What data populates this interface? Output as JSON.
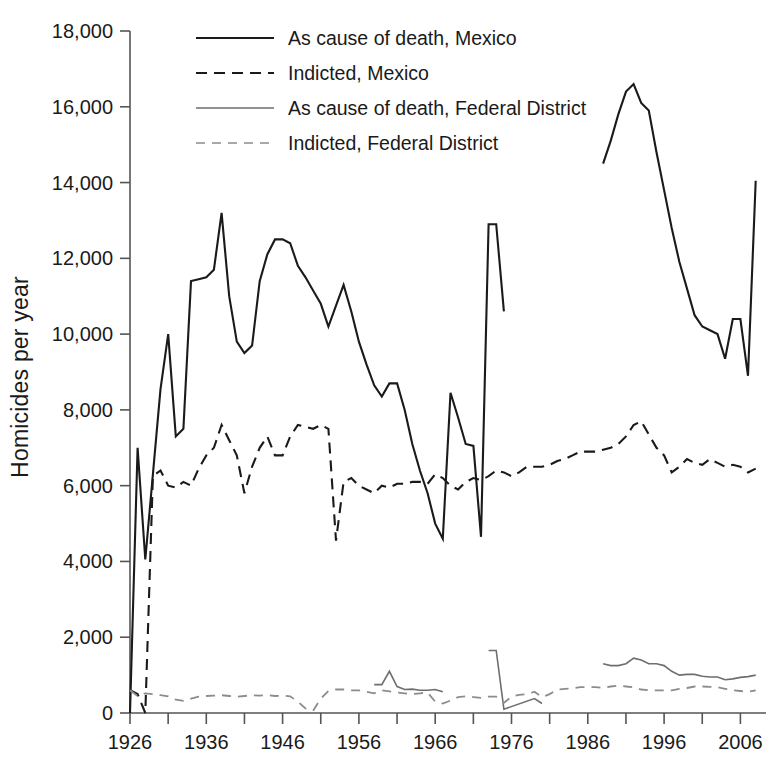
{
  "figure": {
    "title": "",
    "ylabel": "Homicides per year",
    "xlabel": ""
  },
  "axes": {
    "y_ticks": [
      "0",
      "2,000",
      "4,000",
      "6,000",
      "8,000",
      "10,000",
      "12,000",
      "14,000",
      "16,000",
      "18,000"
    ],
    "x_ticks": [
      "1926",
      "1936",
      "1946",
      "1956",
      "1966",
      "1976",
      "1986",
      "1996",
      "2006"
    ],
    "y_min": 0,
    "y_max": 18000,
    "x_min": 1926,
    "x_max": 2008,
    "minor_tick_step_years": 5
  },
  "legend": {
    "items": [
      {
        "label": "As cause of death, Mexico",
        "style": "solid",
        "color": "#1a1a1a",
        "width": 2.1
      },
      {
        "label": "Indicted, Mexico",
        "style": "dashed",
        "color": "#1a1a1a",
        "width": 2.1
      },
      {
        "label": "As cause of death, Federal District",
        "style": "solid",
        "color": "#6e6e6e",
        "width": 1.5
      },
      {
        "label": "Indicted, Federal District",
        "style": "dashed",
        "color": "#8c8c8c",
        "width": 1.7
      }
    ]
  },
  "chart_data": {
    "type": "line",
    "title": "",
    "xlabel": "",
    "ylabel": "Homicides per year",
    "xlim": [
      1926,
      2008
    ],
    "ylim": [
      0,
      18000
    ],
    "grid": false,
    "legend_position": "top-center",
    "series": [
      {
        "name": "As cause of death, Mexico",
        "style": "solid",
        "color": "#1a1a1a",
        "x": [
          1926,
          1927,
          1928,
          1930,
          1931,
          1932,
          1933,
          1934,
          1935,
          1936,
          1937,
          1938,
          1939,
          1940,
          1941,
          1942,
          1943,
          1944,
          1945,
          1946,
          1947,
          1948,
          1949,
          1950,
          1951,
          1952,
          1953,
          1954,
          1955,
          1956,
          1957,
          1958,
          1959,
          1960,
          1961,
          1962,
          1963,
          1964,
          1965,
          1966,
          1967,
          1968,
          1969,
          1970,
          1971,
          1972,
          1973,
          1974,
          1975,
          1988,
          1989,
          1990,
          1991,
          1992,
          1993,
          1994,
          1995,
          1996,
          1997,
          1998,
          1999,
          2000,
          2001,
          2002,
          2003,
          2004,
          2005,
          2006,
          2007,
          2008
        ],
        "values": [
          0,
          7000,
          4050,
          8550,
          10000,
          7300,
          7500,
          11400,
          11450,
          11500,
          11700,
          13200,
          11000,
          9800,
          9500,
          9700,
          11400,
          12100,
          12500,
          12500,
          12400,
          11800,
          11500,
          11150,
          10800,
          10200,
          10750,
          11300,
          10600,
          9800,
          9200,
          8650,
          8350,
          8700,
          8700,
          8000,
          7100,
          6400,
          5800,
          5000,
          4600,
          8450,
          7800,
          7100,
          7050,
          4650,
          12900,
          12900,
          10600,
          14500,
          15100,
          15800,
          16400,
          16600,
          16100,
          15900,
          14800,
          13800,
          12800,
          11900,
          11200,
          10500,
          10200,
          10100,
          10000,
          9350,
          10400,
          10400,
          8900,
          14050
        ]
      },
      {
        "name": "Indicted, Mexico",
        "style": "dashed",
        "color": "#1a1a1a",
        "x": [
          1926,
          1927,
          1928,
          1929,
          1930,
          1931,
          1932,
          1933,
          1934,
          1935,
          1936,
          1937,
          1938,
          1939,
          1940,
          1941,
          1942,
          1943,
          1944,
          1945,
          1946,
          1947,
          1948,
          1949,
          1950,
          1951,
          1952,
          1953,
          1954,
          1955,
          1956,
          1957,
          1958,
          1959,
          1960,
          1961,
          1962,
          1963,
          1964,
          1965,
          1966,
          1967,
          1968,
          1969,
          1970,
          1971,
          1972,
          1973,
          1974,
          1975,
          1976,
          1977,
          1978,
          1979,
          1980,
          1981,
          1982,
          1983,
          1984,
          1985,
          1986,
          1987,
          1988,
          1989,
          1990,
          1991,
          1992,
          1993,
          1994,
          1995,
          1996,
          1997,
          1998,
          1999,
          2000,
          2001,
          2002,
          2003,
          2004,
          2005,
          2006,
          2007,
          2008
        ],
        "values": [
          600,
          500,
          0,
          6250,
          6400,
          6000,
          5950,
          6100,
          6000,
          6450,
          6800,
          7000,
          7600,
          7200,
          6800,
          5800,
          6500,
          7000,
          7300,
          6800,
          6800,
          7300,
          7600,
          7550,
          7500,
          7600,
          7500,
          4550,
          6100,
          6200,
          6000,
          5900,
          5800,
          6000,
          5950,
          6050,
          6050,
          6100,
          6100,
          6050,
          6300,
          6200,
          6000,
          5900,
          6100,
          6200,
          6150,
          6250,
          6400,
          6350,
          6250,
          6350,
          6500,
          6500,
          6500,
          6550,
          6650,
          6700,
          6800,
          6900,
          6900,
          6900,
          6950,
          7000,
          7100,
          7300,
          7600,
          7700,
          7350,
          7000,
          6800,
          6350,
          6500,
          6700,
          6600,
          6550,
          6700,
          6600,
          6500,
          6550,
          6500,
          6350,
          6450
        ]
      },
      {
        "name": "As cause of death, Federal District",
        "style": "solid",
        "color": "#6e6e6e",
        "x": [
          1958,
          1959,
          1960,
          1961,
          1962,
          1963,
          1964,
          1965,
          1966,
          1967,
          1973,
          1974,
          1975,
          1979,
          1980,
          1988,
          1989,
          1990,
          1991,
          1992,
          1993,
          1994,
          1995,
          1996,
          1997,
          1998,
          1999,
          2000,
          2001,
          2002,
          2003,
          2004,
          2005,
          2006,
          2007,
          2008
        ],
        "values": [
          750,
          750,
          1100,
          700,
          620,
          630,
          600,
          600,
          620,
          560,
          1650,
          1650,
          100,
          380,
          250,
          1300,
          1250,
          1250,
          1300,
          1450,
          1400,
          1300,
          1300,
          1250,
          1100,
          1000,
          1020,
          1020,
          970,
          950,
          950,
          880,
          900,
          940,
          960,
          1000
        ]
      },
      {
        "name": "Indicted, Federal District",
        "style": "dashed",
        "color": "#8c8c8c",
        "x": [
          1926,
          1927,
          1928,
          1929,
          1930,
          1931,
          1932,
          1933,
          1934,
          1935,
          1936,
          1937,
          1938,
          1939,
          1940,
          1941,
          1942,
          1943,
          1944,
          1945,
          1946,
          1947,
          1948,
          1949,
          1950,
          1951,
          1952,
          1953,
          1954,
          1955,
          1956,
          1957,
          1958,
          1959,
          1960,
          1961,
          1962,
          1963,
          1964,
          1965,
          1966,
          1967,
          1968,
          1969,
          1970,
          1971,
          1972,
          1973,
          1974,
          1975,
          1976,
          1977,
          1978,
          1979,
          1980,
          1981,
          1982,
          1983,
          1984,
          1985,
          1986,
          1987,
          1988,
          1989,
          1990,
          1991,
          1992,
          1993,
          1994,
          1995,
          1996,
          1997,
          1998,
          1999,
          2000,
          2001,
          2002,
          2003,
          2004,
          2005,
          2006,
          2007,
          2008
        ],
        "values": [
          600,
          450,
          520,
          500,
          470,
          440,
          350,
          320,
          380,
          430,
          450,
          460,
          470,
          450,
          430,
          450,
          470,
          460,
          470,
          450,
          460,
          440,
          300,
          120,
          60,
          380,
          580,
          620,
          620,
          600,
          600,
          560,
          520,
          600,
          570,
          540,
          520,
          500,
          520,
          540,
          300,
          250,
          330,
          420,
          440,
          420,
          400,
          430,
          430,
          270,
          430,
          480,
          500,
          560,
          420,
          500,
          620,
          640,
          650,
          680,
          680,
          680,
          660,
          700,
          720,
          700,
          680,
          620,
          600,
          600,
          600,
          600,
          640,
          660,
          700,
          700,
          690,
          680,
          640,
          600,
          580,
          560,
          600
        ]
      }
    ]
  }
}
